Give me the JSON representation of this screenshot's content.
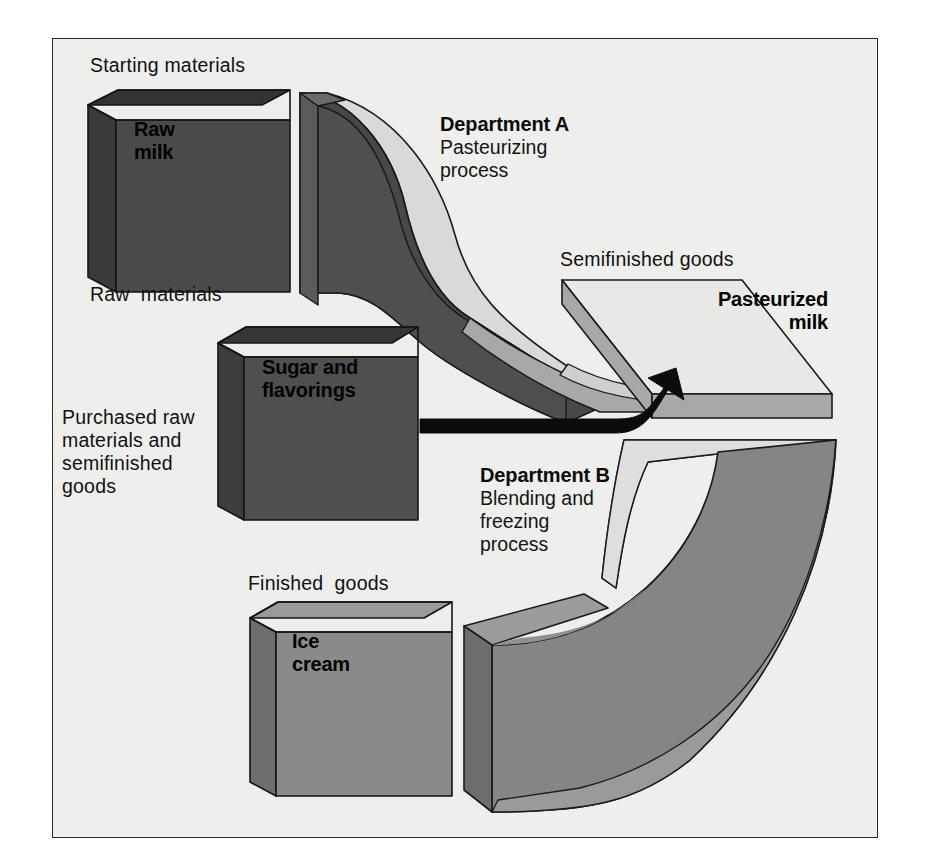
{
  "diagram": {
    "frame": {
      "border_color": "#2a2a2a",
      "fill_color": "#eeeeec"
    }
  },
  "labels": {
    "starting_materials": "Starting materials",
    "raw_materials": "Raw  materials",
    "purchased": "Purchased raw\nmaterials and\nsemifinished\ngoods",
    "semifinished_goods": "Semifinished goods",
    "finished_goods": "Finished  goods"
  },
  "boxes": [
    {
      "id": "raw-milk",
      "label": "Raw\nmilk",
      "caption": "Raw  materials",
      "face_color": "#4a4a4a",
      "top_color": "#333333",
      "side_color": "#3a3a3a"
    },
    {
      "id": "sugar-flavorings",
      "label": "Sugar and\nflavorings",
      "face_color": "#4f4f4f",
      "top_color": "#363636",
      "side_color": "#3d3d3d"
    },
    {
      "id": "pasteurized-milk",
      "label": "Pasteurized\nmilk",
      "face_color": "#e8e8e6",
      "top_color": "#e8e8e6",
      "side_color": "#a8a8a6"
    },
    {
      "id": "ice-cream",
      "label": "Ice\ncream",
      "face_color": "#8a8a8a",
      "top_color": "#9a9a9a",
      "side_color": "#6e6e6e"
    }
  ],
  "departments": [
    {
      "id": "department-a",
      "title": "Department A",
      "subtitle": "Pasteurizing\nprocess",
      "swoosh_body_color": "#484848",
      "swoosh_top_color": "#d6d6d4",
      "swoosh_tail_color": "#a5a5a3"
    },
    {
      "id": "department-b",
      "title": "Department B",
      "subtitle": "Blending and\nfreezing\nprocess",
      "swoosh_body_color": "#858585",
      "swoosh_top_color": "#e9e9e7",
      "swoosh_side_color": "#6d6d6d"
    }
  ],
  "arrow": {
    "id": "flow-arrow",
    "color": "#0b0b0b",
    "from": "sugar-flavorings",
    "to": "pasteurized-milk"
  },
  "colors": {
    "ink": "#111111",
    "paper": "#eeeeec",
    "outline": "#1a1a1a"
  }
}
